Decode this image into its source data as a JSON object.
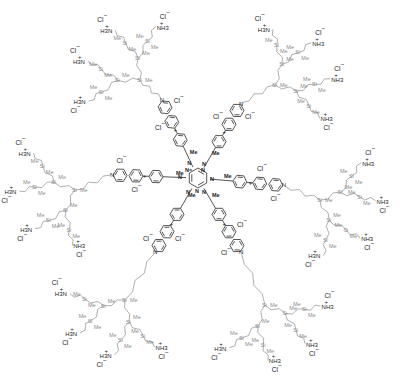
{
  "diagram": {
    "type": "chemical-structure",
    "core": {
      "ring_label": "N",
      "substituent_labels": [
        "Me",
        "N",
        "N"
      ],
      "arm_count": 6
    },
    "labels": {
      "methyl": "Me",
      "silicon": "Si",
      "ammonium_right": "NH3",
      "ammonium_left": "H3N",
      "plus": "+",
      "chloride": "Cl",
      "minus": "−",
      "pyridinium_n": "N"
    },
    "colors": {
      "bond": "#2a2a2a",
      "silane_branch": "#8c8c8c",
      "background": "#ffffff"
    }
  }
}
